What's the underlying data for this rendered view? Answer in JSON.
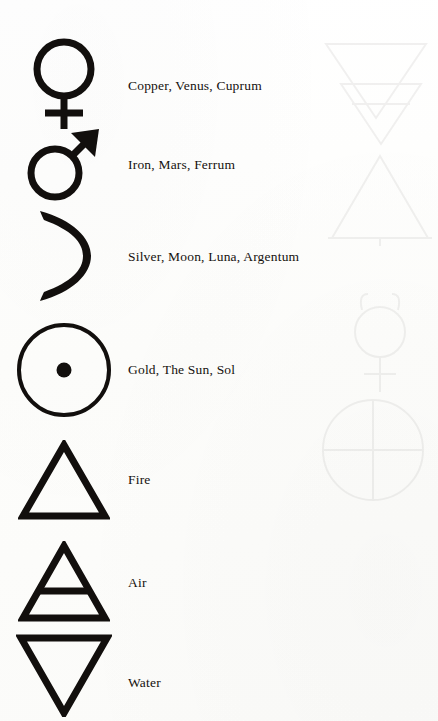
{
  "page": {
    "kind": "scanned-book-page",
    "background_color": "#fdfdfc",
    "ink_color": "#120f0d"
  },
  "rows": [
    {
      "id": "copper",
      "symbol_name": "venus-symbol",
      "label": "Copper, Venus, Cuprum"
    },
    {
      "id": "iron",
      "symbol_name": "mars-symbol",
      "label": "Iron, Mars, Ferrum"
    },
    {
      "id": "silver",
      "symbol_name": "crescent-moon-symbol",
      "label": "Silver, Moon, Luna, Argentum"
    },
    {
      "id": "gold",
      "symbol_name": "sun-symbol",
      "label": "Gold, The Sun, Sol"
    },
    {
      "id": "fire",
      "symbol_name": "fire-triangle-symbol",
      "label": "Fire"
    },
    {
      "id": "air",
      "symbol_name": "air-triangle-symbol",
      "label": "Air"
    },
    {
      "id": "water",
      "symbol_name": "water-triangle-symbol",
      "label": "Water"
    }
  ],
  "show_through": {
    "note": "faint ghost images bleeding through from the reverse side of the page",
    "opacity": 0.055,
    "items": [
      {
        "symbol_name": "inverted-triangle-ghost"
      },
      {
        "symbol_name": "earth-triangle-ghost"
      },
      {
        "symbol_name": "upward-triangle-ghost"
      },
      {
        "symbol_name": "mercury-symbol-ghost"
      },
      {
        "symbol_name": "earth-globe-cross-ghost"
      }
    ]
  }
}
